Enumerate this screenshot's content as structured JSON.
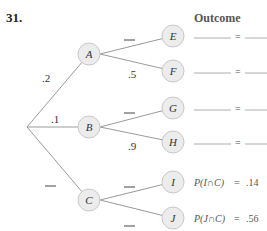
{
  "problem_number": "31.",
  "outcome_header": "Outcome",
  "colors": {
    "node_fill": "#ececec",
    "node_stroke": "#c8c8c8",
    "edge": "#9a9a9a",
    "blank": "#999999"
  },
  "tree": {
    "root": {
      "x": 27,
      "y": 127
    },
    "first_level": [
      {
        "id": "A",
        "label": "A",
        "x": 89,
        "y": 54,
        "edge_prob": ".2",
        "edge_prob_pos": {
          "x": 42,
          "y": 82
        }
      },
      {
        "id": "B",
        "label": "B",
        "x": 89,
        "y": 127,
        "edge_prob": ".1",
        "edge_prob_pos": {
          "x": 51,
          "y": 123
        }
      },
      {
        "id": "C",
        "label": "C",
        "x": 89,
        "y": 200,
        "edge_prob": "—",
        "edge_prob_pos": {
          "x": 45,
          "y": 186
        }
      }
    ],
    "second_level": [
      {
        "id": "E",
        "label": "E",
        "parent": "A",
        "x": 173,
        "y": 36,
        "edge_prob": "—",
        "edge_prob_pos": {
          "x": 124,
          "y": 40
        },
        "outcome": "______ = ____"
      },
      {
        "id": "F",
        "label": "F",
        "parent": "A",
        "x": 173,
        "y": 71,
        "edge_prob": ".5",
        "edge_prob_pos": {
          "x": 128,
          "y": 78
        },
        "outcome": "______ = ____"
      },
      {
        "id": "G",
        "label": "G",
        "parent": "B",
        "x": 173,
        "y": 108,
        "edge_prob": "—",
        "edge_prob_pos": {
          "x": 124,
          "y": 113
        },
        "outcome": "______ = ____"
      },
      {
        "id": "H",
        "label": "H",
        "parent": "B",
        "x": 173,
        "y": 142,
        "edge_prob": ".9",
        "edge_prob_pos": {
          "x": 128,
          "y": 150
        },
        "outcome": "______ = ____"
      },
      {
        "id": "I",
        "label": "I",
        "parent": "C",
        "x": 173,
        "y": 182,
        "edge_prob": "—",
        "edge_prob_pos": {
          "x": 124,
          "y": 187
        },
        "outcome": "P(I ∩ C) = .14"
      },
      {
        "id": "J",
        "label": "J",
        "parent": "C",
        "x": 173,
        "y": 218,
        "edge_prob": "—",
        "edge_prob_pos": {
          "x": 124,
          "y": 226
        },
        "outcome": "P(J ∩ C) = .56"
      }
    ]
  },
  "outcomes": [
    {
      "node": "E",
      "text": "",
      "value": ""
    },
    {
      "node": "F",
      "text": "",
      "value": ""
    },
    {
      "node": "G",
      "text": "",
      "value": ""
    },
    {
      "node": "H",
      "text": "",
      "value": ""
    },
    {
      "node": "I",
      "text": "P(I∩C)",
      "value": ".14"
    },
    {
      "node": "J",
      "text": "P(J∩C)",
      "value": ".56"
    }
  ]
}
